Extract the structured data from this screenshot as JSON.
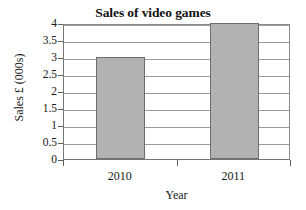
{
  "chart_data": {
    "type": "bar",
    "title": "Sales of video games",
    "xlabel": "Year",
    "ylabel": "Sales £ (000s)",
    "categories": [
      "2010",
      "2011"
    ],
    "values": [
      3,
      4
    ],
    "ylim": [
      0,
      4
    ],
    "ytick_labels": [
      "0",
      "0.5",
      "1",
      "1.5",
      "2",
      "2.5",
      "3",
      "3.5",
      "4"
    ],
    "ytick_values": [
      0,
      0.5,
      1,
      1.5,
      2,
      2.5,
      3,
      3.5,
      4
    ],
    "grid": true,
    "legend": false,
    "bar_color": "#b2b2b2",
    "bar_edge_color": "#6d6d6d",
    "axis_color": "#767676",
    "grid_color": "#9a9a9a",
    "background": "#ffffff"
  }
}
